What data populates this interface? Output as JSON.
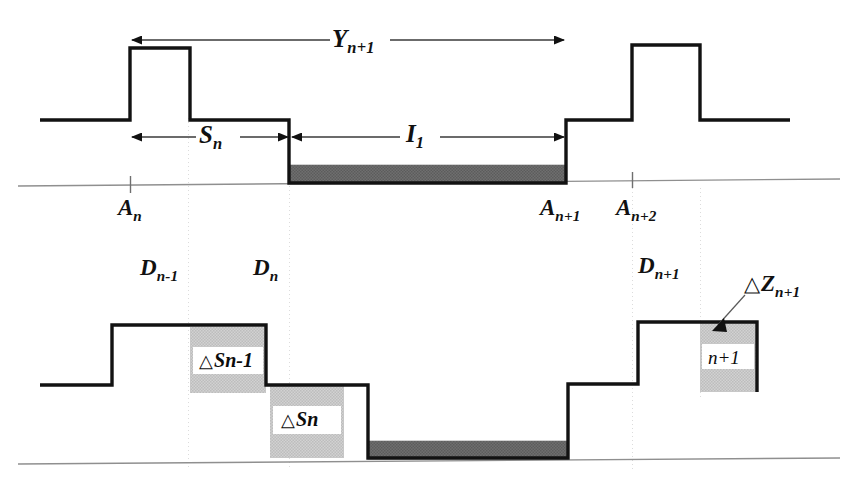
{
  "figure": {
    "kind": "timing-waveform-diagram",
    "colors": {
      "stroke": "#111111",
      "axis": "#8a8a8a",
      "guide": "#d8d8d8",
      "dark_bar": "#6d6d6d",
      "light_bar": "#c9c9c9",
      "label": "#0c0c0c",
      "background": "#ffffff"
    }
  },
  "upper_panel": {
    "dimension_arrows": [
      {
        "name": "Y-span",
        "base": "Y",
        "subscript": "n+1",
        "direction": "double",
        "from_x": 130,
        "to_x": 566,
        "y": 40
      },
      {
        "name": "S-span",
        "base": "S",
        "subscript": "n",
        "direction": "double",
        "from_x": 130,
        "to_x": 289,
        "y": 137
      },
      {
        "name": "I-span",
        "base": "I",
        "subscript": "1",
        "direction": "double",
        "from_x": 291,
        "to_x": 566,
        "y": 137
      }
    ],
    "axis_ticks": [
      {
        "base": "A",
        "subscript": "n",
        "x": 130
      },
      {
        "base": "A",
        "subscript": "n+1",
        "x": 566
      },
      {
        "base": "A",
        "subscript": "n+2",
        "x": 632
      }
    ],
    "shaded_interval": {
      "from_x": 289,
      "to_x": 566,
      "shade": "dark"
    }
  },
  "lower_panel": {
    "region_labels": [
      {
        "base": "D",
        "subscript": "n-1",
        "x": 140,
        "y": 258
      },
      {
        "base": "D",
        "subscript": "n",
        "x": 253,
        "y": 258
      },
      {
        "base": "D",
        "subscript": "n+1",
        "x": 638,
        "y": 256
      }
    ],
    "callout": {
      "name": "delta-Z",
      "delta": "△",
      "base": "Z",
      "subscript": "n+1",
      "x": 748,
      "y": 277
    },
    "shaded_blocks": [
      {
        "name": "delta-S-n-minus-1",
        "delta": "△",
        "base": "S",
        "subscript": "n-1",
        "from_x": 190,
        "to_x": 266,
        "top_y": 327,
        "bottom_y": 393
      },
      {
        "name": "delta-S-n",
        "delta": "△",
        "base": "S",
        "subscript": "n",
        "from_x": 270,
        "to_x": 344,
        "top_y": 385,
        "bottom_y": 458
      },
      {
        "name": "n-plus-1-block",
        "delta": "",
        "base": "",
        "label_plain": "n+1",
        "from_x": 700,
        "to_x": 756,
        "top_y": 322,
        "bottom_y": 392
      }
    ],
    "shaded_interval": {
      "from_x": 368,
      "to_x": 568,
      "shade": "dark"
    }
  }
}
